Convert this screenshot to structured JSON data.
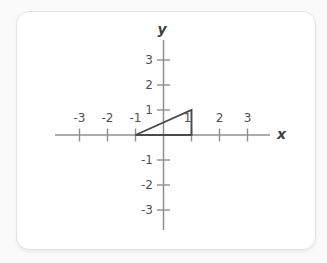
{
  "figure": {
    "x_axis_label": "x",
    "y_axis_label": "y"
  },
  "chart_data": {
    "type": "line",
    "title": "",
    "xlabel": "x",
    "ylabel": "y",
    "xlim": [
      -3.9,
      3.8
    ],
    "ylim": [
      -3.8,
      3.8
    ],
    "x_ticks": [
      -3,
      -2,
      -1,
      1,
      2,
      3
    ],
    "y_ticks": [
      3,
      2,
      1,
      -1,
      -2,
      -3
    ],
    "x_tick_labels": [
      "-3",
      "-2",
      "-1",
      "1",
      "2",
      "3"
    ],
    "y_tick_labels": [
      "3",
      "2",
      "1",
      "-1",
      "-2",
      "-3"
    ],
    "grid": false,
    "legend": "none",
    "series": [
      {
        "name": "triangle",
        "closed": true,
        "points": [
          [
            -1,
            0
          ],
          [
            1,
            0
          ],
          [
            1,
            1
          ]
        ]
      }
    ],
    "colors": {
      "axis": "#8f8f8f",
      "tick_label": "#4f4f4f",
      "shape": "#4a4a4a",
      "card_bg": "#ffffff",
      "card_border": "#e4e4e4"
    }
  }
}
